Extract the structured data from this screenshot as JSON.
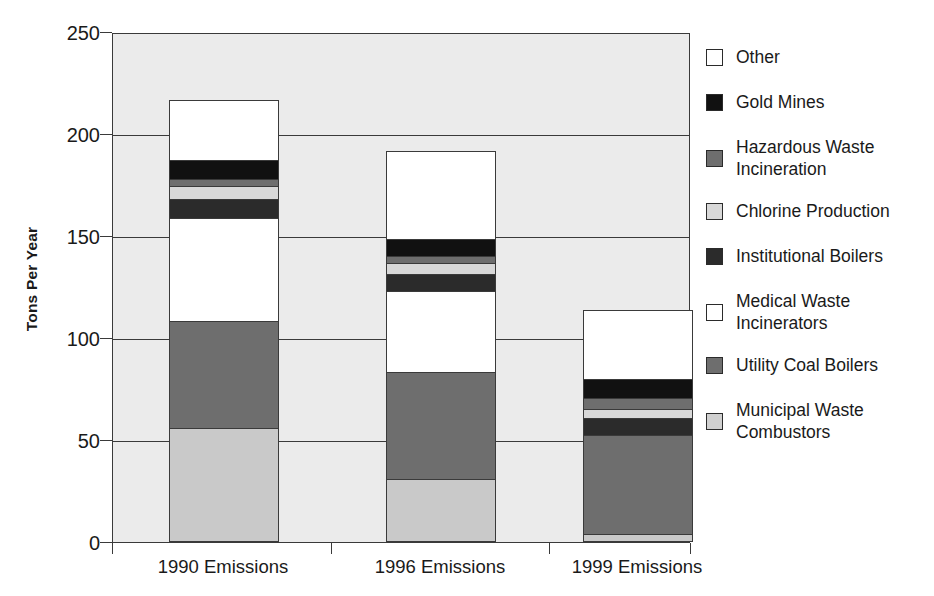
{
  "chart_data": {
    "type": "bar",
    "subtype": "stacked-bar",
    "title": "",
    "xlabel": "",
    "ylabel": "Tons Per Year",
    "ylim": [
      0,
      250
    ],
    "ytick_values": [
      250,
      200,
      150,
      100,
      50,
      0
    ],
    "ytick_labels": [
      "250",
      "200",
      "150",
      "100",
      "50",
      "0"
    ],
    "grid": "horizontal",
    "legend_position": "right",
    "categories": [
      "1990 Emissions",
      "1996 Emissions",
      "1999 Emissions"
    ],
    "series": [
      {
        "name": "Municipal Waste Combustors",
        "color": "#c9c9c9",
        "values": [
          56,
          31,
          4
        ]
      },
      {
        "name": "Utility Coal Boilers",
        "color": "#6e6e6e",
        "values": [
          53,
          53,
          49
        ]
      },
      {
        "name": "Medical Waste Incinerators",
        "color": "#ffffff",
        "values": [
          51,
          40,
          0
        ]
      },
      {
        "name": "Institutional Boilers",
        "color": "#2b2b2b",
        "values": [
          10,
          9,
          9
        ]
      },
      {
        "name": "Chlorine Production",
        "color": "#d8d8d8",
        "values": [
          7,
          6,
          5
        ]
      },
      {
        "name": "Hazardous Waste Incineration",
        "color": "#6e6e6e",
        "values": [
          4,
          4,
          6
        ]
      },
      {
        "name": "Gold Mines",
        "color": "#111111",
        "values": [
          10,
          9,
          10
        ]
      },
      {
        "name": "Other",
        "color": "#ffffff",
        "values": [
          30,
          44,
          34
        ]
      }
    ],
    "totals": [
      221,
      196,
      117
    ]
  },
  "axis": {
    "y_title": "Tons Per Year",
    "ticks": [
      {
        "label": "250",
        "value": 250
      },
      {
        "label": "200",
        "value": 200
      },
      {
        "label": "150",
        "value": 150
      },
      {
        "label": "100",
        "value": 100
      },
      {
        "label": "50",
        "value": 50
      },
      {
        "label": "0",
        "value": 0
      }
    ],
    "x_categories": [
      {
        "label": "1990 Emissions"
      },
      {
        "label": "1996 Emissions"
      },
      {
        "label": "1999 Emissions"
      }
    ]
  },
  "legend": {
    "items": [
      {
        "label": "Other",
        "swatch": "#ffffff",
        "lines": [
          "Other"
        ]
      },
      {
        "label": "Gold Mines",
        "swatch": "#111111",
        "lines": [
          "Gold Mines"
        ]
      },
      {
        "label": "Hazardous Waste Incineration",
        "swatch": "#6e6e6e",
        "lines": [
          "Hazardous Waste",
          "Incineration"
        ]
      },
      {
        "label": "Chlorine Production",
        "swatch": "#d8d8d8",
        "lines": [
          "Chlorine Production"
        ]
      },
      {
        "label": "Institutional Boilers",
        "swatch": "#2b2b2b",
        "lines": [
          "Institutional Boilers"
        ]
      },
      {
        "label": "Medical Waste Incinerators",
        "swatch": "#ffffff",
        "lines": [
          "Medical Waste",
          "Incinerators"
        ]
      },
      {
        "label": "Utility Coal Boilers",
        "swatch": "#6e6e6e",
        "lines": [
          "Utility Coal Boilers"
        ]
      },
      {
        "label": "Municipal Waste Combustors",
        "swatch": "#d0d0d0",
        "lines": [
          "Municipal Waste",
          "Combustors"
        ]
      }
    ]
  },
  "colors": {
    "plot_background": "#ebebeb",
    "axis_line": "#3a3a3a",
    "page_background": "#ffffff"
  }
}
